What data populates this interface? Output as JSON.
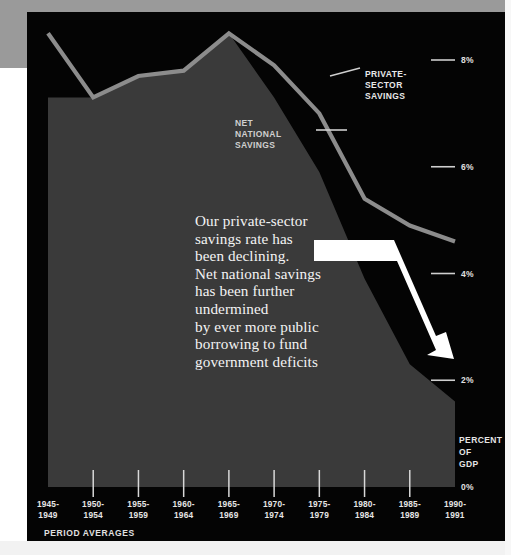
{
  "figure": {
    "axis_note": "PERCENT\nOF\nGDP",
    "footer_note": "PERIOD AVERAGES"
  },
  "annotation": {
    "text": "Our private-sector\nsavings rate has\nbeen declining.\nNet national savings\nhas been further\nundermined\nby ever more public\nborrowing to fund\ngovernment deficits",
    "arrow_name": "decline-arrow"
  },
  "legend": {
    "private": "PRIVATE-\nSECTOR\nSAVINGS",
    "net": "NET\nNATIONAL\nSAVINGS"
  },
  "colors": {
    "background": "#040404",
    "area_fill": "#3a3a3a",
    "line": "#8c8c8c",
    "text": "#e6e6e6",
    "arrow": "#ffffff",
    "paper_edge": "#9a9a9a"
  },
  "chart_data": {
    "type": "area",
    "title": "",
    "subtitle": "",
    "xlabel": "PERIOD AVERAGES",
    "ylabel": "PERCENT OF GDP",
    "ylim": [
      0,
      8.8
    ],
    "grid": false,
    "legend_position": "inline-annotations",
    "yticks": [
      {
        "label": "8%",
        "value": 8
      },
      {
        "label": "6%",
        "value": 6
      },
      {
        "label": "4%",
        "value": 4
      },
      {
        "label": "2%",
        "value": 2
      },
      {
        "label": "0%",
        "value": 0
      }
    ],
    "categories": [
      "1945-\n1949",
      "1950-\n1954",
      "1955-\n1959",
      "1960-\n1964",
      "1965-\n1969",
      "1970-\n1974",
      "1975-\n1979",
      "1980-\n1984",
      "1985-\n1989",
      "1990-\n1991"
    ],
    "series": [
      {
        "name": "PRIVATE-SECTOR SAVINGS",
        "style": "line",
        "values": [
          8.5,
          7.3,
          7.7,
          7.8,
          8.5,
          7.9,
          7.0,
          5.4,
          4.9,
          4.6
        ]
      },
      {
        "name": "NET NATIONAL SAVINGS",
        "style": "area",
        "values": [
          7.3,
          7.3,
          7.7,
          7.8,
          8.5,
          7.3,
          5.9,
          3.9,
          2.3,
          1.6
        ]
      }
    ]
  }
}
